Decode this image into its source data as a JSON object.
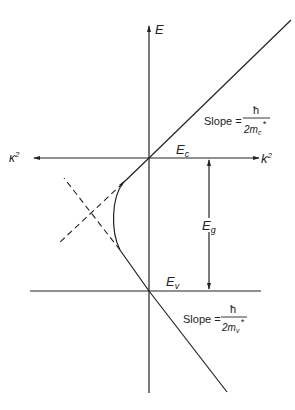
{
  "diagram": {
    "type": "energy-band-diagram",
    "axes": {
      "vertical_label": "E",
      "left_horizontal_label": "κ",
      "left_horizontal_exp": "2",
      "right_horizontal_label": "k",
      "right_horizontal_exp": "2"
    },
    "levels": {
      "conduction": {
        "label": "E",
        "sub": "c"
      },
      "valence": {
        "label": "E",
        "sub": "v"
      },
      "gap": {
        "label": "E",
        "sub": "g"
      }
    },
    "conduction_slope": {
      "prefix": "Slope =",
      "numerator": "ħ",
      "denominator_base": "2m",
      "denominator_sub": "c",
      "denominator_sup": "*"
    },
    "valence_slope": {
      "prefix": "Slope =",
      "numerator": "ħ",
      "denominator_base": "2m",
      "denominator_sub": "v",
      "denominator_sup": "*"
    },
    "colors": {
      "line": "#222222",
      "background": "#ffffff"
    }
  }
}
